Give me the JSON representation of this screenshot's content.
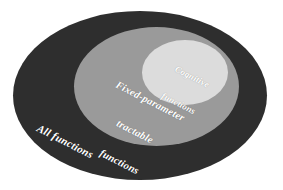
{
  "diagram": {
    "type": "nested-ellipse-venn",
    "background_color": "#ffffff",
    "regions": [
      {
        "name": "all-functions",
        "label": "All functions",
        "lines": [
          "All functions"
        ],
        "fill_color": "#2e2e2e",
        "text_color": "#ffffff",
        "level": 1
      },
      {
        "name": "fixed-parameter-tractable-functions",
        "label": "Fixed-parameter tractable functions",
        "lines": [
          "Fixed-parameter",
          "tractable",
          "functions"
        ],
        "fill_color": "#9a9a9a",
        "text_color": "#ffffff",
        "level": 2
      },
      {
        "name": "cognitive-functions",
        "label": "Cognitive functions",
        "lines": [
          "Cognitive",
          "functions"
        ],
        "fill_color": "#dcdcdc",
        "text_color": "#ffffff",
        "level": 3
      }
    ]
  }
}
